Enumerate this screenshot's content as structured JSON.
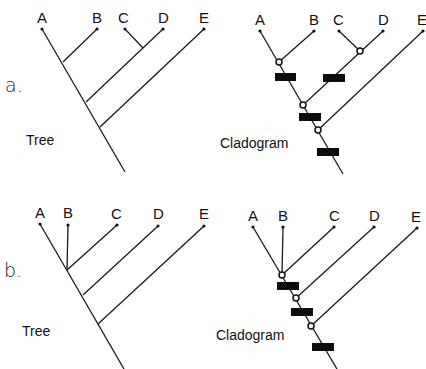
{
  "figure": {
    "panels": [
      {
        "id": "a",
        "label": "a.",
        "tree": {
          "caption": "Tree",
          "taxa": [
            "A",
            "B",
            "C",
            "D",
            "E"
          ],
          "topology": "((A,B),(C,D)),E"
        },
        "cladogram": {
          "caption": "Cladogram",
          "taxa": [
            "A",
            "B",
            "C",
            "D",
            "E"
          ],
          "topology": "((A,B),(C,D)),E",
          "synapomorphy_bars": 4,
          "nodes": 4
        }
      },
      {
        "id": "b",
        "label": "b.",
        "tree": {
          "caption": "Tree",
          "taxa": [
            "A",
            "B",
            "C",
            "D",
            "E"
          ],
          "topology": "(((A,B,C),D),E)"
        },
        "cladogram": {
          "caption": "Cladogram",
          "taxa": [
            "A",
            "B",
            "C",
            "D",
            "E"
          ],
          "topology": "(((A,B,C),D),E)",
          "synapomorphy_bars": 3,
          "nodes": 3
        }
      }
    ],
    "colors": {
      "line": "#1a1a1a",
      "bar": "#0d0d0d",
      "background": "#ffffff"
    }
  }
}
